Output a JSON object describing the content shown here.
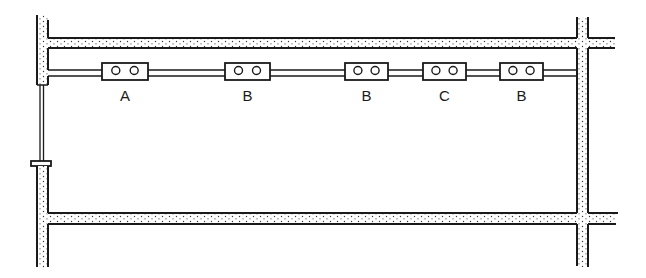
{
  "diagram": {
    "type": "duct-and-pipe layout",
    "colors": {
      "line": "#1a1a1a",
      "duct_fill": "#ffffff",
      "stipple": "#3a3a3a",
      "background": "#ffffff"
    },
    "units": [
      {
        "id": "unit-1",
        "label": "A",
        "x": 102,
        "w": 46
      },
      {
        "id": "unit-2",
        "label": "B",
        "x": 225,
        "w": 45
      },
      {
        "id": "unit-3",
        "label": "B",
        "x": 345,
        "w": 43
      },
      {
        "id": "unit-4",
        "label": "C",
        "x": 423,
        "w": 43
      },
      {
        "id": "unit-5",
        "label": "B",
        "x": 500,
        "w": 43
      }
    ]
  }
}
